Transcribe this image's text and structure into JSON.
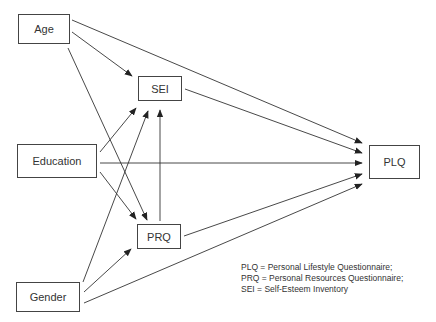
{
  "diagram": {
    "type": "path-diagram",
    "nodes": [
      {
        "id": "age",
        "label": "Age",
        "x": 18,
        "y": 14,
        "w": 52,
        "h": 30
      },
      {
        "id": "sei",
        "label": "SEI",
        "x": 138,
        "y": 76,
        "w": 44,
        "h": 25
      },
      {
        "id": "education",
        "label": "Education",
        "x": 17,
        "y": 144,
        "w": 80,
        "h": 34
      },
      {
        "id": "prq",
        "label": "PRQ",
        "x": 137,
        "y": 224,
        "w": 44,
        "h": 25
      },
      {
        "id": "gender",
        "label": "Gender",
        "x": 16,
        "y": 282,
        "w": 64,
        "h": 30
      },
      {
        "id": "plq",
        "label": "PLQ",
        "x": 369,
        "y": 145,
        "w": 51,
        "h": 34
      }
    ],
    "edges": [
      {
        "from": "age",
        "to": "plq",
        "x1": 72,
        "y1": 20,
        "x2": 362,
        "y2": 143
      },
      {
        "from": "age",
        "to": "sei",
        "x1": 72,
        "y1": 32,
        "x2": 132,
        "y2": 76
      },
      {
        "from": "age",
        "to": "prq",
        "x1": 68,
        "y1": 48,
        "x2": 147,
        "y2": 220
      },
      {
        "from": "sei",
        "to": "plq",
        "x1": 185,
        "y1": 89,
        "x2": 362,
        "y2": 153
      },
      {
        "from": "education",
        "to": "sei",
        "x1": 100,
        "y1": 152,
        "x2": 136,
        "y2": 108
      },
      {
        "from": "education",
        "to": "plq",
        "x1": 100,
        "y1": 163,
        "x2": 362,
        "y2": 163
      },
      {
        "from": "education",
        "to": "prq",
        "x1": 100,
        "y1": 172,
        "x2": 136,
        "y2": 219
      },
      {
        "from": "prq",
        "to": "sei",
        "x1": 160,
        "y1": 221,
        "x2": 160,
        "y2": 110
      },
      {
        "from": "prq",
        "to": "plq",
        "x1": 184,
        "y1": 236,
        "x2": 362,
        "y2": 174
      },
      {
        "from": "gender",
        "to": "sei",
        "x1": 83,
        "y1": 282,
        "x2": 148,
        "y2": 111
      },
      {
        "from": "gender",
        "to": "prq",
        "x1": 84,
        "y1": 292,
        "x2": 131,
        "y2": 249
      },
      {
        "from": "gender",
        "to": "plq",
        "x1": 84,
        "y1": 303,
        "x2": 362,
        "y2": 184
      }
    ]
  },
  "legend": {
    "lines": [
      "PLQ = Personal Lifestyle Questionnaire;",
      "PRQ = Personal Resources Questionnaire;",
      "SEI = Self-Esteem Inventory"
    ]
  },
  "colors": {
    "line": "#333333",
    "box_border": "#444444",
    "background": "#ffffff"
  }
}
